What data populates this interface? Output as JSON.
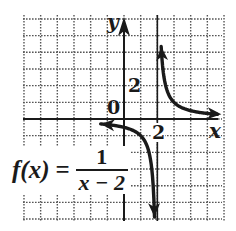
{
  "chart_data": {
    "type": "line",
    "title": "",
    "function_label": {
      "lhs": "f(x)",
      "eq": "=",
      "numerator": "1",
      "denominator": "x − 2"
    },
    "xlabel": "x",
    "ylabel": "y",
    "xlim": [
      -6,
      6
    ],
    "ylim": [
      -6,
      6
    ],
    "grid": true,
    "grid_spacing": 1,
    "origin_label": "0",
    "tick_labels": [
      {
        "axis": "x",
        "value": 2,
        "text": "2"
      },
      {
        "axis": "y",
        "value": 2,
        "text": "2"
      }
    ],
    "asymptotes": [
      {
        "type": "vertical",
        "x": 2
      },
      {
        "type": "horizontal",
        "y": 0
      }
    ],
    "series": [
      {
        "name": "right branch",
        "x": [
          2.23,
          2.3,
          2.5,
          2.75,
          3,
          3.5,
          4,
          4.5,
          5,
          5.6
        ],
        "y": [
          4.35,
          3.33,
          2.0,
          1.33,
          1.0,
          0.67,
          0.5,
          0.4,
          0.33,
          0.28
        ]
      },
      {
        "name": "left branch",
        "x": [
          -1.4,
          -1,
          -0.5,
          0,
          0.5,
          1,
          1.3,
          1.5,
          1.7,
          1.83
        ],
        "y": [
          -0.29,
          -0.33,
          -0.4,
          -0.5,
          -0.67,
          -1.0,
          -1.43,
          -2.0,
          -3.33,
          -5.9
        ]
      }
    ],
    "colors": {
      "curve": "#1a1a1a",
      "axes": "#1a1a1a",
      "grid": "#555555",
      "background": "#ffffff"
    }
  }
}
